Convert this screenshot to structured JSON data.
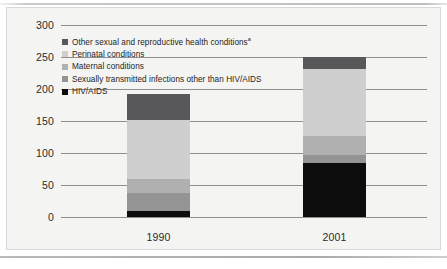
{
  "chart_data": {
    "type": "bar",
    "subtype": "stacked-bar",
    "title": "",
    "xlabel": "",
    "ylabel": "",
    "categories": [
      "1990",
      "2001"
    ],
    "ylim": [
      0,
      300
    ],
    "yticks": [
      0,
      50,
      100,
      150,
      200,
      250,
      300
    ],
    "ytick_labels": [
      "0",
      "50",
      "100",
      "150",
      "200",
      "250",
      "300"
    ],
    "grid": true,
    "legend_position": "upper-left-inside",
    "stack_order_bottom_to_top": [
      "HIV/AIDS",
      "Sexually transmitted infections other than HIV/AIDS",
      "Maternal conditions",
      "Perinatal conditions",
      "Other sexual and reproductive health conditions"
    ],
    "series": [
      {
        "name": "Other sexual and reproductive health conditions",
        "label_suffix": "a",
        "color": "#58585a",
        "values": [
          41,
          18
        ]
      },
      {
        "name": "Perinatal conditions",
        "label_suffix": "",
        "color": "#cfcfcf",
        "values": [
          92,
          105
        ]
      },
      {
        "name": "Maternal conditions",
        "label_suffix": "",
        "color": "#b0b0b0",
        "values": [
          22,
          30
        ]
      },
      {
        "name": "Sexually transmitted infections other than HIV/AIDS",
        "label_suffix": "",
        "color": "#949494",
        "values": [
          28,
          12
        ]
      },
      {
        "name": "HIV/AIDS",
        "label_suffix": "",
        "color": "#0d0d0d",
        "values": [
          10,
          85
        ]
      }
    ],
    "totals": [
      193,
      250
    ]
  },
  "legend": {
    "items": [
      {
        "label": "Other sexual and reproductive health conditions",
        "suffix": "a",
        "color": "#58585a"
      },
      {
        "label": "Perinatal conditions",
        "suffix": "",
        "color": "#cfcfcf"
      },
      {
        "label": "Maternal conditions",
        "suffix": "",
        "color": "#b0b0b0"
      },
      {
        "label": "Sexually transmitted infections other than HIV/AIDS",
        "suffix": "",
        "color": "#949494"
      },
      {
        "label": "HIV/AIDS",
        "suffix": "",
        "color": "#0d0d0d"
      }
    ]
  },
  "colors": {
    "page_background": "#ffffff",
    "chart_background": "#f4f4f2",
    "gridline": "#8f8f8f",
    "text": "#1d1d1d"
  }
}
